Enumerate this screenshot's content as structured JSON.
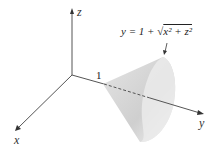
{
  "diagram": {
    "axes": {
      "x_label": "x",
      "y_label": "y",
      "z_label": "z"
    },
    "tick_label": "1",
    "equation": {
      "lhs": "y = 1 + ",
      "radicand": "x² + z²"
    },
    "surface": "cone"
  }
}
